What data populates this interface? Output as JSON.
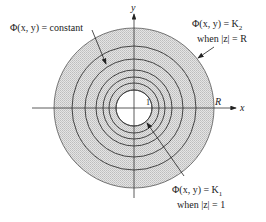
{
  "diagram": {
    "type": "level curves in annular region",
    "center": {
      "x": 134,
      "y": 108
    },
    "outer_radius": 80,
    "inner_radius": 18,
    "ring_radii": [
      25,
      31,
      38,
      49,
      62
    ],
    "colors": {
      "fill": "#cfcfcf",
      "line": "#333333",
      "background": "#ffffff"
    }
  },
  "axes": {
    "x_label": "x",
    "y_label": "y",
    "tick_inner": "1",
    "tick_outer": "R"
  },
  "labels": {
    "constant": "Φ(x, y) = constant",
    "outer_line1": "Φ(x, y) = K",
    "outer_sub": "2",
    "outer_line2": "when |z| = R",
    "inner_line1": "Φ(x, y) = K",
    "inner_sub": "1",
    "inner_line2": "when |z| = 1"
  }
}
